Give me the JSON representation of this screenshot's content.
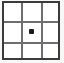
{
  "icon": {
    "name": "grid-with-center-dot-icon",
    "description": "3x3 grid frame with a filled dot in the center cell",
    "rows": 3,
    "columns": 3,
    "cells": [
      {
        "row": 1,
        "column": 1,
        "marked": false
      },
      {
        "row": 1,
        "column": 2,
        "marked": false
      },
      {
        "row": 1,
        "column": 3,
        "marked": false
      },
      {
        "row": 2,
        "column": 1,
        "marked": false
      },
      {
        "row": 2,
        "column": 2,
        "marked": true
      },
      {
        "row": 2,
        "column": 3,
        "marked": false
      },
      {
        "row": 3,
        "column": 1,
        "marked": false
      },
      {
        "row": 3,
        "column": 2,
        "marked": false
      },
      {
        "row": 3,
        "column": 3,
        "marked": false
      }
    ],
    "marker": {
      "name": "center-dot",
      "cell_row": 2,
      "cell_column": 2,
      "shape": "square-dot"
    },
    "colors": {
      "background": "#f7f7f6",
      "cell_fill": "#ffffff",
      "outer_border": "#3b3b3b",
      "inner_grid_line": "#6e6e6e",
      "dot": "#1a1a1a"
    }
  }
}
